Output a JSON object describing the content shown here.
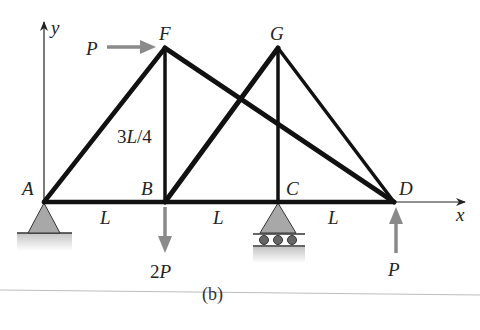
{
  "diagram": {
    "caption": "(b)",
    "axes": {
      "x_label": "x",
      "y_label": "y"
    },
    "nodes": [
      {
        "id": "A",
        "label": "A",
        "x": 44,
        "y": 202
      },
      {
        "id": "B",
        "label": "B",
        "x": 165,
        "y": 202
      },
      {
        "id": "C",
        "label": "C",
        "x": 278,
        "y": 202
      },
      {
        "id": "D",
        "label": "D",
        "x": 394,
        "y": 202
      },
      {
        "id": "F",
        "label": "F",
        "x": 165,
        "y": 48
      },
      {
        "id": "G",
        "label": "G",
        "x": 278,
        "y": 48
      }
    ],
    "members": [
      [
        "A",
        "B"
      ],
      [
        "B",
        "C"
      ],
      [
        "C",
        "D"
      ],
      [
        "A",
        "F"
      ],
      [
        "F",
        "B"
      ],
      [
        "F",
        "D"
      ],
      [
        "B",
        "G"
      ],
      [
        "G",
        "C"
      ],
      [
        "G",
        "D"
      ]
    ],
    "dimensions": {
      "height_label": "3L/4",
      "span_labels": [
        "L",
        "L",
        "L"
      ]
    },
    "loads": [
      {
        "at": "F",
        "label": "P",
        "direction": "right"
      },
      {
        "at": "B",
        "label": "2P",
        "direction": "down"
      },
      {
        "at": "D",
        "label": "P",
        "direction": "up"
      }
    ],
    "supports": [
      {
        "at": "A",
        "type": "pin"
      },
      {
        "at": "C",
        "type": "roller"
      }
    ],
    "colors": {
      "member": "#111111",
      "load_arrow": "#8a8a8a",
      "support_fill": "#a8a8a8",
      "ground": "#c8c8c8"
    }
  }
}
